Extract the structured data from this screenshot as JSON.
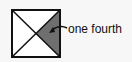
{
  "diagram": {
    "shape": "square divided by both diagonals into four triangles",
    "shaded_region": "right triangle",
    "shade_color": "#6f6f6f",
    "stroke_color": "#111111",
    "fill_color": "#ffffff",
    "label": "one fourth",
    "arrow": "curved arrow from label pointing to shaded triangle"
  }
}
